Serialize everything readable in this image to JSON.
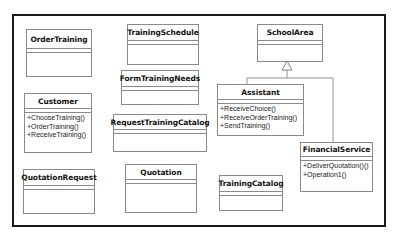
{
  "diagram": {
    "type": "uml-class-diagram",
    "classes": [
      {
        "id": "order-training",
        "name": "OrderTraining",
        "operations": []
      },
      {
        "id": "training-schedule",
        "name": "TrainingSchedule",
        "operations": []
      },
      {
        "id": "school-area",
        "name": "SchoolArea",
        "operations": []
      },
      {
        "id": "form-training-needs",
        "name": "FormTrainingNeeds",
        "operations": []
      },
      {
        "id": "customer",
        "name": "Customer",
        "operations": [
          "+ChooseTraining()",
          "+OrderTraining()",
          "+ReceiveTraining()"
        ]
      },
      {
        "id": "assistant",
        "name": "Assistant",
        "operations": [
          "+ReceiveChoice()",
          "+ReceiveOrderTraining()",
          "+SendTraining()"
        ]
      },
      {
        "id": "request-training-catalog",
        "name": "RequestTrainingCatalog",
        "operations": []
      },
      {
        "id": "financial-service",
        "name": "FinancialService",
        "operations": [
          "+DeliverQuotation()()",
          "+Operation1()"
        ]
      },
      {
        "id": "quotation-request",
        "name": "QuotationRequest",
        "operations": []
      },
      {
        "id": "quotation",
        "name": "Quotation",
        "operations": []
      },
      {
        "id": "training-catalog",
        "name": "TrainingCatalog",
        "operations": []
      }
    ],
    "relations": [
      {
        "type": "generalization",
        "from": "Assistant",
        "to": "SchoolArea"
      },
      {
        "type": "generalization",
        "from": "FinancialService",
        "to": "SchoolArea"
      }
    ]
  }
}
